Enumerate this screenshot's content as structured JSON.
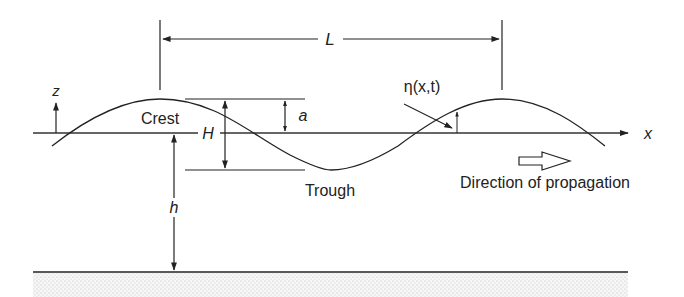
{
  "diagram": {
    "labels": {
      "wavelength": "L",
      "vertical_axis": "z",
      "horizontal_axis": "x",
      "crest": "Crest",
      "trough": "Trough",
      "wave_height": "H",
      "amplitude": "a",
      "water_depth": "h",
      "surface_elevation": "η(x,t)",
      "direction": "Direction of propagation"
    },
    "colors": {
      "line": "#222222",
      "background": "#ffffff",
      "seabed_dots": "#bdbdbd"
    },
    "geometry": {
      "mean_water_level_y": 133,
      "crest_y": 99,
      "trough_y": 170,
      "seabed_y": 272,
      "crest1_x": 160,
      "crest2_x": 502,
      "trough_x": 331
    }
  }
}
